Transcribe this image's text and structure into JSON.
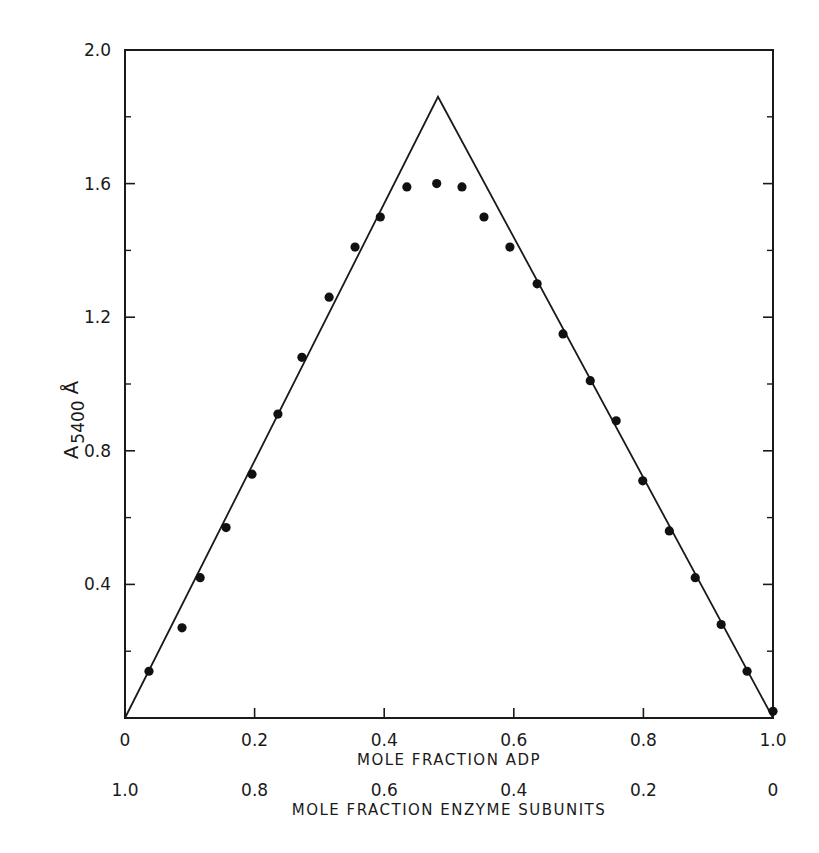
{
  "chart_data": {
    "type": "scatter",
    "title": "",
    "xlabel": "MOLE FRACTION ADP",
    "xlabel_secondary": "MOLE FRACTION ENZYME SUBUNITS",
    "ylabel": "A",
    "ylabel_subscript": "5400",
    "ylabel_unit": "Å",
    "xlim": [
      0,
      1.0
    ],
    "ylim": [
      0,
      2.0
    ],
    "x_ticks": [
      {
        "value": 0,
        "label": "0"
      },
      {
        "value": 0.2,
        "label": "0.2"
      },
      {
        "value": 0.4,
        "label": "0.4"
      },
      {
        "value": 0.6,
        "label": "0.6"
      },
      {
        "value": 0.8,
        "label": "0.8"
      },
      {
        "value": 1.0,
        "label": "1.0"
      }
    ],
    "x_ticks_secondary": [
      {
        "value": 0,
        "label": "1.0"
      },
      {
        "value": 0.2,
        "label": "0.8"
      },
      {
        "value": 0.4,
        "label": "0.6"
      },
      {
        "value": 0.6,
        "label": "0.4"
      },
      {
        "value": 0.8,
        "label": "0.2"
      },
      {
        "value": 1.0,
        "label": "0"
      }
    ],
    "y_ticks": [
      {
        "value": 0.4,
        "label": "0.4"
      },
      {
        "value": 0.8,
        "label": "0.8"
      },
      {
        "value": 1.2,
        "label": "1.2"
      },
      {
        "value": 1.6,
        "label": "1.6"
      },
      {
        "value": 2.0,
        "label": "2.0"
      }
    ],
    "y_minor_ticks": [
      0.2,
      0.6,
      1.0,
      1.4,
      1.8
    ],
    "grid": false,
    "legend": null,
    "series": [
      {
        "name": "measured absorbance",
        "kind": "points",
        "x": [
          0.037,
          0.088,
          0.116,
          0.156,
          0.196,
          0.236,
          0.273,
          0.315,
          0.355,
          0.394,
          0.435,
          0.481,
          0.52,
          0.554,
          0.594,
          0.636,
          0.676,
          0.718,
          0.758,
          0.799,
          0.84,
          0.88,
          0.92,
          0.96,
          1.0
        ],
        "y": [
          0.14,
          0.27,
          0.42,
          0.57,
          0.73,
          0.91,
          1.08,
          1.26,
          1.41,
          1.5,
          1.59,
          1.6,
          1.59,
          1.5,
          1.41,
          1.3,
          1.15,
          1.01,
          0.89,
          0.71,
          0.56,
          0.42,
          0.28,
          0.14,
          0.02
        ]
      },
      {
        "name": "theoretical triangle",
        "kind": "line",
        "x": [
          0,
          0.483,
          1.0
        ],
        "y": [
          0,
          1.86,
          0
        ]
      }
    ]
  }
}
